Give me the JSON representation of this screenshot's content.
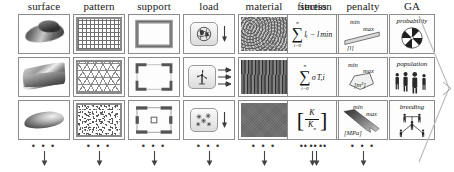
{
  "figure": {
    "rows": 3,
    "columns": 9,
    "continuation_dots": "• • •"
  },
  "columns": [
    {
      "key": "surface",
      "label": "surface"
    },
    {
      "key": "pattern",
      "label": "pattern"
    },
    {
      "key": "support",
      "label": "support"
    },
    {
      "key": "load",
      "label": "load"
    },
    {
      "key": "material",
      "label": "material"
    },
    {
      "key": "section",
      "label": "section"
    },
    {
      "key": "fitness",
      "label": "fitness"
    },
    {
      "key": "penalty",
      "label": "penalty"
    },
    {
      "key": "ga",
      "label": "GA"
    }
  ],
  "cells": {
    "surface": [
      {
        "name": "surface-thumb-1",
        "desc": "shaded freeform double-curved surface"
      },
      {
        "name": "surface-thumb-2",
        "desc": "shaded saddle / hypar surface"
      },
      {
        "name": "surface-thumb-3",
        "desc": "shaded ellipsoidal dome surface"
      }
    ],
    "pattern": [
      {
        "name": "pattern-thumb-1",
        "desc": "orthogonal square grid mesh"
      },
      {
        "name": "pattern-thumb-2",
        "desc": "triangular / hexagonal lattice mesh"
      },
      {
        "name": "pattern-thumb-3",
        "desc": "random stochastic point mesh"
      }
    ],
    "support": [
      {
        "name": "support-thumb-1",
        "desc": "continuous perimeter support ring"
      },
      {
        "name": "support-thumb-2",
        "desc": "corner supports at four edges"
      },
      {
        "name": "support-thumb-3",
        "desc": "point supports with central column"
      }
    ],
    "load": [
      {
        "name": "load-thumb-1",
        "icon": "globe-icon",
        "desc": "self weight / gravity load",
        "arrows": 1
      },
      {
        "name": "load-thumb-2",
        "icon": "wind-turbine-icon",
        "desc": "wind load",
        "arrows": 3
      },
      {
        "name": "load-thumb-3",
        "icon": "snowflake-icon",
        "desc": "snow load",
        "arrows": 1
      }
    ],
    "material": [
      {
        "name": "material-thumb-1",
        "desc": "concrete texture"
      },
      {
        "name": "material-thumb-2",
        "desc": "timber grain texture"
      },
      {
        "name": "material-thumb-3",
        "desc": "steel / dark uniform texture"
      }
    ],
    "section": [
      {
        "name": "section-thumb-1",
        "desc": "I-section profile"
      },
      {
        "name": "section-thumb-2",
        "desc": "hollow box section profile"
      },
      {
        "name": "section-thumb-3",
        "desc": "H-section with flanges profile"
      }
    ],
    "fitness": [
      {
        "name": "fitness-formula-1",
        "type": "sum",
        "sum_upper": "n",
        "sum_lower": "i=0",
        "expression": "lᵢ − l",
        "expression_sub": "min"
      },
      {
        "name": "fitness-formula-2",
        "type": "sum",
        "sum_upper": "n",
        "sum_lower": "i=0",
        "expression": "σ",
        "expression_sub": "T,i"
      },
      {
        "name": "fitness-formula-3",
        "type": "fraction",
        "numerator": "K",
        "denominator": "K",
        "denominator_sub": "n",
        "bracket_left": "[",
        "bracket_right": "]"
      }
    ],
    "penalty": [
      {
        "name": "penalty-thumb-1",
        "min_label": "min",
        "max_label": "max",
        "unit": "[l]",
        "glyph": "bar-element-icon"
      },
      {
        "name": "penalty-thumb-2",
        "min_label": "min",
        "max_label": "max",
        "unit": "[m²]",
        "glyph": "pentagon-panel-icon"
      },
      {
        "name": "penalty-thumb-3",
        "min_label": "min",
        "max_label": "max",
        "unit": "[MPa]",
        "glyph": "stress-arrow-icon"
      }
    ],
    "ga": [
      {
        "name": "ga-thumb-1",
        "caption": "probability",
        "glyph": "roulette-wheel-icon"
      },
      {
        "name": "ga-thumb-2",
        "caption": "population",
        "glyph": "population-figures-icon"
      },
      {
        "name": "ga-thumb-3",
        "caption": "breeding",
        "glyph": "breeding-tree-icon"
      }
    ]
  }
}
